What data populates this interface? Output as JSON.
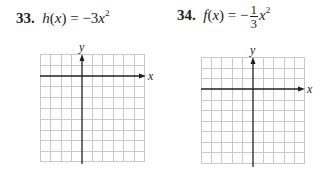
{
  "problems": [
    {
      "number": "33.",
      "func_name": "h",
      "var": "x",
      "lhs_open": "(",
      "lhs_close": ")",
      "equals": "=",
      "rhs_sign": "−",
      "rhs_coef": "3",
      "rhs_var": "x",
      "rhs_exp": "2",
      "axis_x_label": "x",
      "axis_y_label": "y"
    },
    {
      "number": "34.",
      "func_name": "f",
      "var": "x",
      "lhs_open": "(",
      "lhs_close": ")",
      "equals": "=",
      "rhs_sign": "−",
      "frac_num": "1",
      "frac_den": "3",
      "rhs_var": "x",
      "rhs_exp": "2",
      "axis_x_label": "x",
      "axis_y_label": "y"
    }
  ],
  "grid_color": "#c8c8c8",
  "axis_color": "#231f20"
}
